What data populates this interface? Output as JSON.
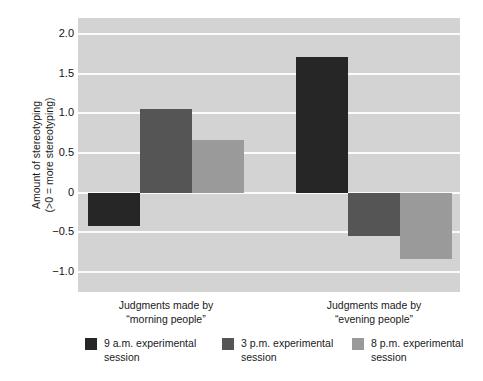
{
  "chart_data": {
    "type": "bar",
    "title": "",
    "xlabel": "",
    "ylabel": "Amount of stereotyping\n(>0 = more stereotyping)",
    "categories": [
      "Judgments made by\n“morning people”",
      "Judgments made by\n“evening people”"
    ],
    "series": [
      {
        "name": "9 a.m. experimental\nsession",
        "color": "#262626",
        "values": [
          -0.42,
          1.71
        ]
      },
      {
        "name": "3 p.m. experimental\nsession",
        "color": "#555555",
        "values": [
          1.06,
          -0.55
        ]
      },
      {
        "name": "8 p.m. experimental\nsession",
        "color": "#9a9a9a",
        "values": [
          0.66,
          -0.84
        ]
      }
    ],
    "ylim": [
      -1.25,
      2.2
    ],
    "yticks": [
      2.0,
      1.5,
      1.0,
      0.5,
      0,
      -0.5,
      -1.0
    ],
    "ytick_labels": [
      "2.0",
      "1.5",
      "1.0",
      "0.5",
      "0",
      "−0.5",
      "−1.0"
    ],
    "grid": true,
    "gridlines_color": "#fbfbfb",
    "plot_background": "#d3d3d3",
    "legend_position": "bottom"
  },
  "legend": {
    "items": [
      {
        "label": "9 a.m. experimental\nsession",
        "color": "#262626"
      },
      {
        "label": "3 p.m. experimental\nsession",
        "color": "#555555"
      },
      {
        "label": "8 p.m. experimental\nsession",
        "color": "#9a9a9a"
      }
    ]
  }
}
